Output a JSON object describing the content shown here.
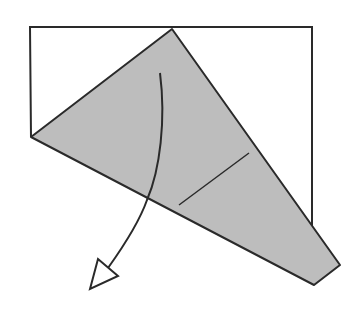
{
  "diagram": {
    "colors": {
      "background": "#ffffff",
      "paper_fill": "#bdbdbd",
      "line": "#2a2a2a"
    },
    "elements": {
      "paper_outline": {
        "description": "rectangle sheet outline (back layer)"
      },
      "folded_flap": {
        "description": "gray folded triangular flap"
      },
      "crease_line": {
        "description": "short crease line on flap"
      },
      "fold_arrow": {
        "description": "curved fold-down arrow with hollow head"
      }
    }
  }
}
